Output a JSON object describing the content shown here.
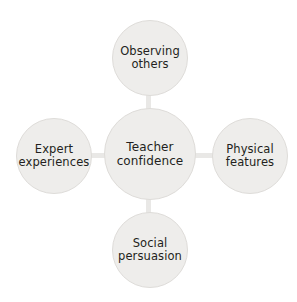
{
  "diagram": {
    "type": "hub-and-spoke",
    "title": "Teacher confidence",
    "center": {
      "id": "teacher-confidence",
      "label": "Teacher\nconfidence"
    },
    "nodes": [
      {
        "id": "observing-others",
        "label": "Observing\nothers",
        "position": "top"
      },
      {
        "id": "physical-features",
        "label": "Physical\nfeatures",
        "position": "right"
      },
      {
        "id": "social-persuasion",
        "label": "Social\npersuasion",
        "position": "bottom"
      },
      {
        "id": "expert-experiences",
        "label": "Expert\nexperiences",
        "position": "left"
      }
    ],
    "connectors": [
      {
        "id": "center-to-observing-others",
        "from": "teacher-confidence",
        "to": "observing-others"
      },
      {
        "id": "center-to-physical-features",
        "from": "teacher-confidence",
        "to": "physical-features"
      },
      {
        "id": "center-to-social-persuasion",
        "from": "teacher-confidence",
        "to": "social-persuasion"
      },
      {
        "id": "center-to-expert-experiences",
        "from": "teacher-confidence",
        "to": "expert-experiences"
      }
    ],
    "colors": {
      "background": "#ffffff",
      "node_fill": "#eeedeb",
      "node_border": "#dedcd9",
      "connector": "#e9e8e6",
      "text": "#231f20"
    }
  }
}
